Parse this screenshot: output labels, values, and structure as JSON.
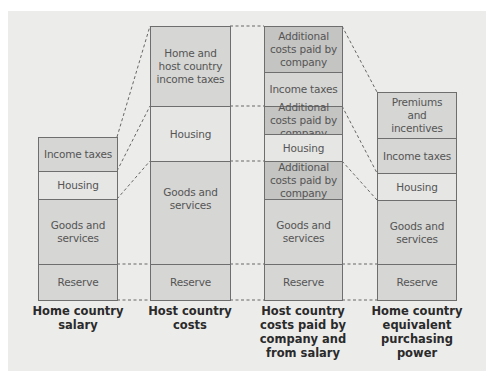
{
  "diagram": {
    "colors": {
      "background_panel": "#ececea",
      "segment_standard": "#d6d6d4",
      "segment_light": "#e6e6e4",
      "segment_additional_costs": "#c4c4c2",
      "border": "#6e6e6e",
      "connector": "#666666"
    },
    "columns": [
      {
        "id": "home-country-salary",
        "caption": "Home country salary",
        "segments": [
          {
            "label": "Income taxes",
            "tone": "mid"
          },
          {
            "label": "Housing",
            "tone": "light"
          },
          {
            "label": "Goods and services",
            "tone": "mid"
          },
          {
            "label": "Reserve",
            "tone": "mid"
          }
        ]
      },
      {
        "id": "host-country-costs",
        "caption": "Host country costs",
        "segments": [
          {
            "label": "Home and host country income taxes",
            "tone": "mid"
          },
          {
            "label": "Housing",
            "tone": "light"
          },
          {
            "label": "Goods and services",
            "tone": "mid"
          },
          {
            "label": "Reserve",
            "tone": "mid"
          }
        ]
      },
      {
        "id": "host-country-costs-paid-by-company-and-from-salary",
        "caption": "Host country costs paid by company and from salary",
        "segments": [
          {
            "label": "Additional costs paid by company",
            "tone": "dark"
          },
          {
            "label": "Income taxes",
            "tone": "mid"
          },
          {
            "label": "Additional costs paid by company",
            "tone": "dark"
          },
          {
            "label": "Housing",
            "tone": "light"
          },
          {
            "label": "Additional costs paid by company",
            "tone": "dark"
          },
          {
            "label": "Goods and services",
            "tone": "mid"
          },
          {
            "label": "Reserve",
            "tone": "mid"
          }
        ]
      },
      {
        "id": "home-country-equivalent-purchasing-power",
        "caption": "Home country equivalent purchasing power",
        "segments": [
          {
            "label": "Premiums and incentives",
            "tone": "mid"
          },
          {
            "label": "Income taxes",
            "tone": "mid"
          },
          {
            "label": "Housing",
            "tone": "light"
          },
          {
            "label": "Goods and services",
            "tone": "mid"
          },
          {
            "label": "Reserve",
            "tone": "mid"
          }
        ]
      }
    ]
  }
}
